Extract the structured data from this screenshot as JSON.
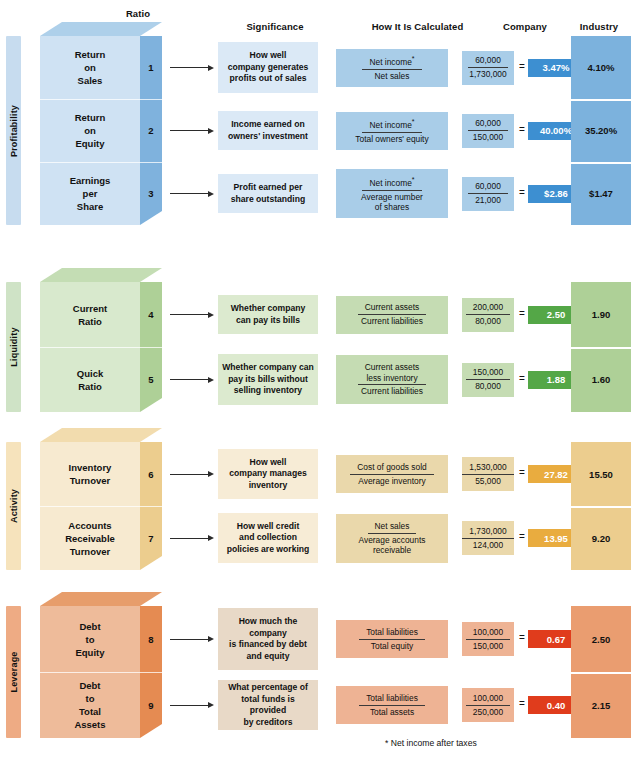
{
  "headers": {
    "ratio": "Ratio",
    "significance": "Significance",
    "calculated": "How It Is Calculated",
    "company": "Company",
    "industry": "Industry"
  },
  "footnote": "* Net income after taxes",
  "colors": {
    "profitability_tab": "#c7dcef",
    "profitability_front": "#cfe2f3",
    "profitability_side": "#7fb2dd",
    "profitability_top": "#aed0ea",
    "profitability_sig": "#dbe9f6",
    "profitability_formula": "#a9cde8",
    "profitability_result": "#3d8fd1",
    "profitability_industry": "#7cb2dd",
    "liquidity_tab": "#cfe3c6",
    "liquidity_front": "#d8e9cd",
    "liquidity_side": "#aed097",
    "liquidity_top": "#c4ddb4",
    "liquidity_sig": "#dceacf",
    "liquidity_formula": "#c5dcb3",
    "liquidity_result": "#54a747",
    "liquidity_industry": "#aed097",
    "activity_tab": "#f6e3bc",
    "activity_front": "#f7ead0",
    "activity_side": "#eccd8e",
    "activity_top": "#f2dcae",
    "activity_sig": "#f7ecd6",
    "activity_formula": "#ead8ab",
    "activity_result": "#e9ac3f",
    "activity_industry": "#eccd8e",
    "leverage_tab": "#eeab84",
    "leverage_front": "#eebb9a",
    "leverage_side": "#e58b52",
    "leverage_top": "#e79d6b",
    "leverage_sig": "#e8d9c7",
    "leverage_formula": "#eeb394",
    "leverage_result": "#e03c1c",
    "leverage_industry": "#ea9d70"
  },
  "groups": [
    {
      "key": "profitability",
      "category": "Profitability",
      "rows": [
        {
          "number": "1",
          "name_lines": [
            "Return",
            "on",
            "Sales"
          ],
          "significance_lines": [
            "How well",
            "company generates",
            "profits out of sales"
          ],
          "formula_numerator": "Net income",
          "formula_numerator_asterisk": true,
          "formula_denominator": "Net sales",
          "value_numerator": "60,000",
          "value_denominator": "1,730,000",
          "equals": "=",
          "company": "3.47%",
          "industry": "4.10%"
        },
        {
          "number": "2",
          "name_lines": [
            "Return",
            "on",
            "Equity"
          ],
          "significance_lines": [
            "Income earned on",
            "owners' investment"
          ],
          "formula_numerator": "Net income",
          "formula_numerator_asterisk": true,
          "formula_denominator": "Total owners' equity",
          "value_numerator": "60,000",
          "value_denominator": "150,000",
          "equals": "=",
          "company": "40.00%",
          "industry": "35.20%"
        },
        {
          "number": "3",
          "name_lines": [
            "Earnings",
            "per",
            "Share"
          ],
          "significance_lines": [
            "Profit earned per",
            "share outstanding"
          ],
          "formula_numerator": "Net income",
          "formula_numerator_asterisk": true,
          "formula_denominator": "Average number\nof shares",
          "value_numerator": "60,000",
          "value_denominator": "21,000",
          "equals": "=",
          "company": "$2.86",
          "industry": "$1.47"
        }
      ]
    },
    {
      "key": "liquidity",
      "category": "Liquidity",
      "rows": [
        {
          "number": "4",
          "name_lines": [
            "Current",
            "Ratio"
          ],
          "significance_lines": [
            "Whether company",
            "can pay its bills"
          ],
          "formula_numerator": "Current assets",
          "formula_numerator_asterisk": false,
          "formula_denominator": "Current liabilities",
          "value_numerator": "200,000",
          "value_denominator": "80,000",
          "equals": "=",
          "company": "2.50",
          "industry": "1.90"
        },
        {
          "number": "5",
          "name_lines": [
            "Quick",
            "Ratio"
          ],
          "significance_lines": [
            "Whether company can",
            "pay its bills without",
            "selling inventory"
          ],
          "formula_numerator": "Current assets\nless inventory",
          "formula_numerator_asterisk": false,
          "formula_denominator": "Current liabilities",
          "value_numerator": "150,000",
          "value_denominator": "80,000",
          "equals": "=",
          "company": "1.88",
          "industry": "1.60"
        }
      ]
    },
    {
      "key": "activity",
      "category": "Activity",
      "rows": [
        {
          "number": "6",
          "name_lines": [
            "Inventory",
            "Turnover"
          ],
          "significance_lines": [
            "How well",
            "company manages",
            "inventory"
          ],
          "formula_numerator": "Cost of goods sold",
          "formula_numerator_asterisk": false,
          "formula_denominator": "Average inventory",
          "value_numerator": "1,530,000",
          "value_denominator": "55,000",
          "equals": "=",
          "company": "27.82",
          "industry": "15.50"
        },
        {
          "number": "7",
          "name_lines": [
            "Accounts",
            "Receivable",
            "Turnover"
          ],
          "significance_lines": [
            "How well credit",
            "and collection",
            "policies are working"
          ],
          "formula_numerator": "Net sales",
          "formula_numerator_asterisk": false,
          "formula_denominator": "Average accounts\nreceivable",
          "value_numerator": "1,730,000",
          "value_denominator": "124,000",
          "equals": "=",
          "company": "13.95",
          "industry": "9.20"
        }
      ]
    },
    {
      "key": "leverage",
      "category": "Leverage",
      "rows": [
        {
          "number": "8",
          "name_lines": [
            "Debt",
            "to",
            "Equity"
          ],
          "significance_lines": [
            "How much the",
            "company",
            "is financed by debt",
            "and equity"
          ],
          "formula_numerator": "Total liabilities",
          "formula_numerator_asterisk": false,
          "formula_denominator": "Total equity",
          "value_numerator": "100,000",
          "value_denominator": "150,000",
          "equals": "=",
          "company": "0.67",
          "industry": "2.50"
        },
        {
          "number": "9",
          "name_lines": [
            "Debt",
            "to",
            "Total",
            "Assets"
          ],
          "significance_lines": [
            "What percentage of",
            "total funds is provided",
            "by creditors"
          ],
          "formula_numerator": "Total liabilities",
          "formula_numerator_asterisk": false,
          "formula_denominator": "Total assets",
          "value_numerator": "100,000",
          "value_denominator": "250,000",
          "equals": "=",
          "company": "0.40",
          "industry": "2.15"
        }
      ]
    }
  ],
  "chart_data": {
    "type": "table",
    "columns": [
      "Ratio",
      "Significance",
      "How It Is Calculated",
      "Company",
      "Industry"
    ],
    "categories": [
      "Profitability",
      "Liquidity",
      "Activity",
      "Leverage"
    ],
    "rows": [
      {
        "n": 1,
        "category": "Profitability",
        "ratio": "Return on Sales",
        "formula": "Net income* / Net sales",
        "numbers": "60,000 / 1,730,000",
        "company": "3.47%",
        "industry": "4.10%"
      },
      {
        "n": 2,
        "category": "Profitability",
        "ratio": "Return on Equity",
        "formula": "Net income* / Total owners' equity",
        "numbers": "60,000 / 150,000",
        "company": "40.00%",
        "industry": "35.20%"
      },
      {
        "n": 3,
        "category": "Profitability",
        "ratio": "Earnings per Share",
        "formula": "Net income* / Average number of shares",
        "numbers": "60,000 / 21,000",
        "company": "$2.86",
        "industry": "$1.47"
      },
      {
        "n": 4,
        "category": "Liquidity",
        "ratio": "Current Ratio",
        "formula": "Current assets / Current liabilities",
        "numbers": "200,000 / 80,000",
        "company": "2.50",
        "industry": "1.90"
      },
      {
        "n": 5,
        "category": "Liquidity",
        "ratio": "Quick Ratio",
        "formula": "Current assets less inventory / Current liabilities",
        "numbers": "150,000 / 80,000",
        "company": "1.88",
        "industry": "1.60"
      },
      {
        "n": 6,
        "category": "Activity",
        "ratio": "Inventory Turnover",
        "formula": "Cost of goods sold / Average inventory",
        "numbers": "1,530,000 / 55,000",
        "company": "27.82",
        "industry": "15.50"
      },
      {
        "n": 7,
        "category": "Activity",
        "ratio": "Accounts Receivable Turnover",
        "formula": "Net sales / Average accounts receivable",
        "numbers": "1,730,000 / 124,000",
        "company": "13.95",
        "industry": "9.20"
      },
      {
        "n": 8,
        "category": "Leverage",
        "ratio": "Debt to Equity",
        "formula": "Total liabilities / Total equity",
        "numbers": "100,000 / 150,000",
        "company": "0.67",
        "industry": "2.50"
      },
      {
        "n": 9,
        "category": "Leverage",
        "ratio": "Debt to Total Assets",
        "formula": "Total liabilities / Total assets",
        "numbers": "100,000 / 250,000",
        "company": "0.40",
        "industry": "2.15"
      }
    ],
    "footnote": "* Net income after taxes"
  }
}
